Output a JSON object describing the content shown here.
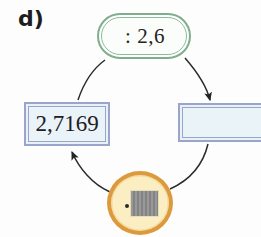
{
  "figure": {
    "part_label": "d)",
    "kind": "cycle-diagram",
    "width": 261,
    "height": 237
  },
  "nodes": {
    "display": {
      "id": "display-node",
      "label": ": 2,6",
      "shape": "rounded-pill",
      "border_color": "#7fae8c",
      "fill_color": "#fbfdfb",
      "position": "top"
    },
    "result": {
      "id": "result-box",
      "label": "2,7169",
      "shape": "rectangle",
      "border_color": "#9aa5cb",
      "fill_color": "#eaf3f8",
      "position": "left"
    },
    "empty": {
      "id": "empty-box",
      "label": "",
      "shape": "rectangle",
      "border_color": "#9aa5cb",
      "fill_color": "#eaf3f8",
      "position": "right"
    },
    "device": {
      "id": "device-node",
      "label": "",
      "icon": "calculator-chip-icon",
      "shape": "circle",
      "border_color": "#dd9a3c",
      "fill_color": "#faeec2",
      "chip_color": "#8d8d8d",
      "position": "bottom"
    }
  },
  "edges": [
    {
      "id": "edge-display-to-empty",
      "from": "display",
      "to": "empty",
      "arrowhead": true,
      "stroke_color": "#2b2b2b"
    },
    {
      "id": "edge-empty-to-device",
      "from": "empty",
      "to": "device",
      "arrowhead": false,
      "stroke_color": "#2b2b2b"
    },
    {
      "id": "edge-device-to-result",
      "from": "device",
      "to": "result",
      "arrowhead": true,
      "stroke_color": "#2b2b2b"
    },
    {
      "id": "edge-result-to-display",
      "from": "result",
      "to": "display",
      "arrowhead": false,
      "stroke_color": "#2b2b2b"
    }
  ]
}
